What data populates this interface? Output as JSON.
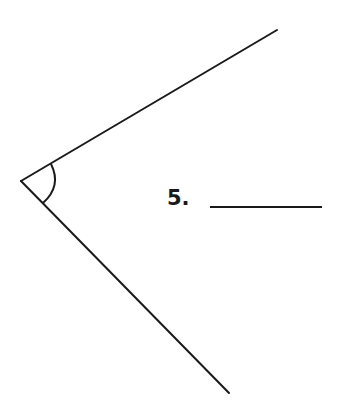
{
  "problem": {
    "number_label": "5.",
    "answer_blank": ""
  },
  "figure": {
    "type": "angle",
    "vertex": [
      21,
      181
    ],
    "ray_upper_end": [
      277,
      30
    ],
    "ray_lower_end": [
      229,
      393
    ],
    "arc_marker": true,
    "line_color": "#1a1a1a"
  }
}
